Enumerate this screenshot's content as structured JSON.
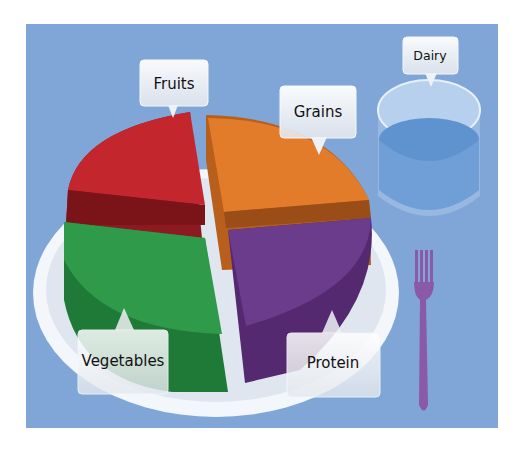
{
  "colors": {
    "background": "#7fa6d6",
    "plate": "#e9eef4",
    "fruits": "#c4262e",
    "grains": "#e37c2a",
    "vegetables": "#2f9a4a",
    "protein": "#6b3b8c",
    "dairy": "#5f93cf",
    "fork": "#8a5aa8"
  },
  "labels": {
    "fruits": "Fruits",
    "grains": "Grains",
    "vegetables": "Vegetables",
    "protein": "Protein",
    "dairy": "Dairy"
  }
}
